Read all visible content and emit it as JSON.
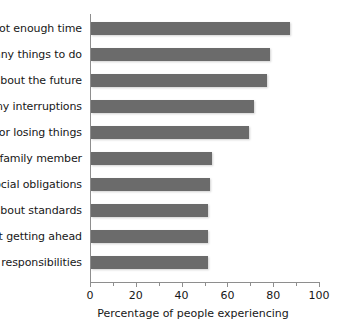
{
  "chart_data": {
    "type": "bar",
    "orientation": "horizontal",
    "title": "",
    "xlabel": "Percentage of people experiencing",
    "ylabel": "",
    "xlim": [
      0,
      100
    ],
    "xticks": [
      0,
      20,
      40,
      60,
      80,
      100
    ],
    "xtick_labels": [
      "0",
      "20",
      "40",
      "60",
      "80",
      "100"
    ],
    "grid": false,
    "legend": false,
    "bar_color": "#6b6b6b",
    "axis_color": "#8e8e8e",
    "text_color": "#171717",
    "categories": [
      "Not enough time",
      "many things to do",
      "about the future",
      "any interruptions",
      "g or losing things",
      "f a family member",
      "Social obligations",
      "s about standards",
      "ut getting ahead",
      "y responsibilities"
    ],
    "values": [
      87,
      78,
      77,
      71,
      69,
      53,
      52,
      51,
      51,
      51
    ]
  }
}
